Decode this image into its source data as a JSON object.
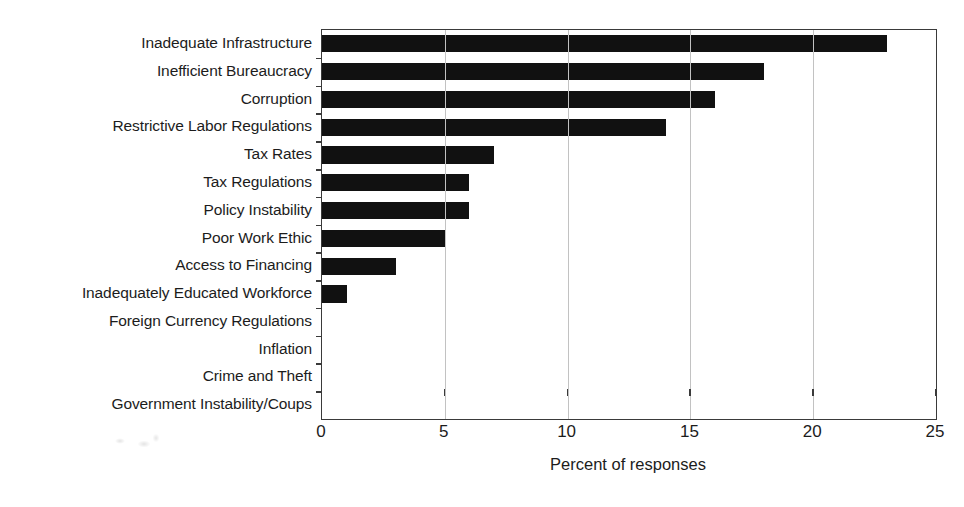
{
  "chart_data": {
    "type": "bar",
    "orientation": "horizontal",
    "title": "",
    "xlabel": "Percent of responses",
    "ylabel": "",
    "xlim": [
      0,
      25
    ],
    "xticks": [
      0,
      5,
      10,
      15,
      20,
      25
    ],
    "xtick_labels": [
      "0",
      "5",
      "10",
      "15",
      "20",
      "25"
    ],
    "grid": "vertical",
    "legend": "none",
    "bar_color": "#111111",
    "categories": [
      "Inadequate Infrastructure",
      "Inefficient Bureaucracy",
      "Corruption",
      "Restrictive Labor Regulations",
      "Tax Rates",
      "Tax Regulations",
      "Policy Instability",
      "Poor Work Ethic",
      "Access to Financing",
      "Inadequately Educated Workforce",
      "Foreign Currency Regulations",
      "Inflation",
      "Crime and Theft",
      "Government Instability/Coups"
    ],
    "values": [
      23,
      18,
      16,
      14,
      7,
      6,
      6,
      5,
      3,
      1,
      0,
      0,
      0,
      0
    ]
  }
}
